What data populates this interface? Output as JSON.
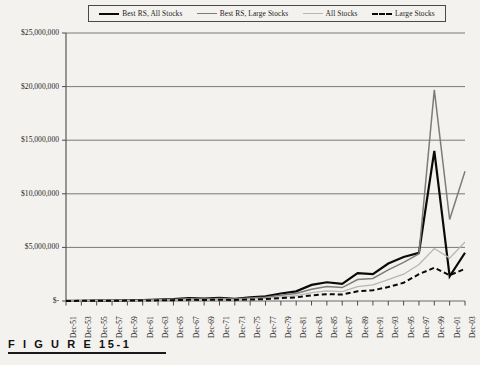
{
  "figure": {
    "caption": "F I G U R E  15-1",
    "background_color": "#f4f2ee"
  },
  "legend": {
    "position": "top",
    "entries": [
      {
        "label": "Best RS, All Stocks",
        "style": "solid",
        "color": "#0a0a0a",
        "width": 2.2,
        "swatch_class": "sw-thick-black"
      },
      {
        "label": "Best RS, Large Stocks",
        "style": "solid",
        "color": "#7c7c7c",
        "width": 1.5,
        "swatch_class": "sw-gray"
      },
      {
        "label": "All Stocks",
        "style": "solid",
        "color": "#b6b6b6",
        "width": 1.3,
        "swatch_class": "sw-lightgray"
      },
      {
        "label": "Large Stocks",
        "style": "dashed",
        "color": "#0a0a0a",
        "width": 2.0,
        "swatch_class": "sw-dashed"
      }
    ]
  },
  "chart_data": {
    "type": "line",
    "title": "",
    "subtitle": "",
    "xlabel": "",
    "ylabel": "",
    "grid": true,
    "grid_axis": "y",
    "legend_position": "top",
    "ylim": [
      0,
      25000000
    ],
    "ytick_values": [
      0,
      5000000,
      10000000,
      15000000,
      20000000,
      25000000
    ],
    "ytick_labels": [
      "$-",
      "$5,000,000",
      "$10,000,000",
      "$15,000,000",
      "$20,000,000",
      "$25,000,000"
    ],
    "categories": [
      "Dec-51",
      "Dec-53",
      "Dec-55",
      "Dec-57",
      "Dec-59",
      "Dec-61",
      "Dec-63",
      "Dec-65",
      "Dec-67",
      "Dec-69",
      "Dec-71",
      "Dec-73",
      "Dec-75",
      "Dec-77",
      "Dec-79",
      "Dec-81",
      "Dec-83",
      "Dec-85",
      "Dec-87",
      "Dec-89",
      "Dec-91",
      "Dec-93",
      "Dec-95",
      "Dec-97",
      "Dec-99",
      "Dec-01",
      "Dec-03"
    ],
    "series": [
      {
        "name": "Best RS, All Stocks",
        "style": "solid",
        "color": "#0a0a0a",
        "width": 2.2,
        "values": [
          10000,
          22000,
          45000,
          40000,
          70000,
          95000,
          130000,
          175000,
          260000,
          230000,
          290000,
          210000,
          330000,
          430000,
          700000,
          900000,
          1500000,
          1750000,
          1600000,
          2600000,
          2500000,
          3500000,
          4100000,
          4500000,
          14000000,
          2300000,
          4500000
        ]
      },
      {
        "name": "Best RS, Large Stocks",
        "style": "solid",
        "color": "#7c7c7c",
        "width": 1.5,
        "values": [
          9000,
          18000,
          38000,
          34000,
          58000,
          78000,
          105000,
          140000,
          200000,
          185000,
          235000,
          175000,
          270000,
          340000,
          540000,
          700000,
          1100000,
          1350000,
          1250000,
          2000000,
          2100000,
          2900000,
          3600000,
          4400000,
          19700000,
          7600000,
          12100000
        ]
      },
      {
        "name": "All Stocks",
        "style": "solid",
        "color": "#b6b6b6",
        "width": 1.3,
        "values": [
          8000,
          15000,
          30000,
          27000,
          45000,
          60000,
          80000,
          105000,
          150000,
          135000,
          170000,
          125000,
          195000,
          245000,
          390000,
          500000,
          780000,
          950000,
          880000,
          1350000,
          1500000,
          2000000,
          2500000,
          3400000,
          4900000,
          4000000,
          5500000
        ]
      },
      {
        "name": "Large Stocks",
        "style": "dashed",
        "color": "#0a0a0a",
        "width": 2.0,
        "values": [
          7000,
          13000,
          25000,
          22000,
          36000,
          48000,
          62000,
          80000,
          110000,
          100000,
          125000,
          92000,
          140000,
          175000,
          270000,
          340000,
          530000,
          640000,
          600000,
          900000,
          1000000,
          1300000,
          1700000,
          2500000,
          3100000,
          2400000,
          3000000
        ]
      }
    ]
  }
}
